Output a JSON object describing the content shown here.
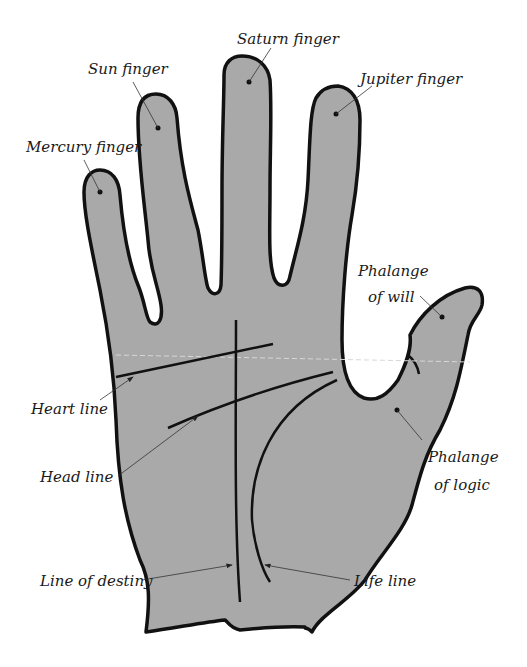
{
  "diagram": {
    "colors": {
      "hand_fill": "#a9a9a9",
      "outline": "#111111",
      "background": "#ffffff"
    },
    "labels": {
      "saturn": "Saturn finger",
      "sun": "Sun finger",
      "jupiter": "Jupiter finger",
      "mercury": "Mercury finger",
      "phalange_will_1": "Phalange",
      "phalange_will_2": "of will",
      "heart_line": "Heart line",
      "head_line": "Head line",
      "phalange_logic_1": "Phalange",
      "phalange_logic_2": "of logic",
      "line_of_destiny": "Line of destiny",
      "life_line": "Life line"
    }
  }
}
